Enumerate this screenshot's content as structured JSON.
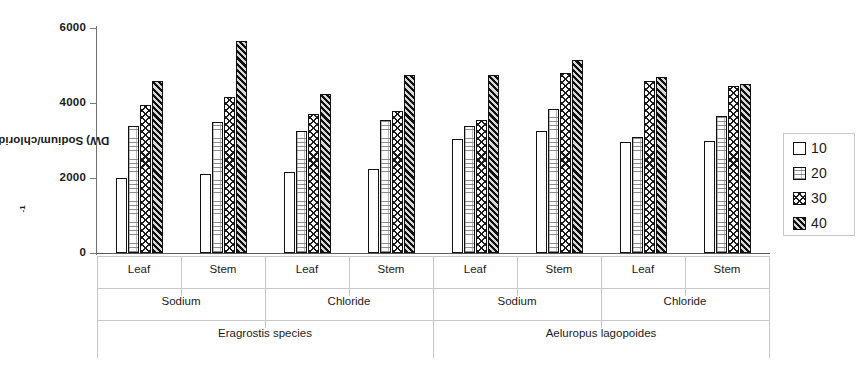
{
  "chart_data": {
    "type": "bar",
    "title": "",
    "xlabel": "",
    "ylabel": "Sodium/chloride (µmole g DW)",
    "ylabel_parts": {
      "main": "Sodium/chloride (µmole g",
      "sup": "-1",
      "tail": " DW)"
    },
    "ylim": [
      0,
      6000
    ],
    "yticks": [
      0,
      2000,
      4000,
      6000
    ],
    "ytick_labels": [
      "0",
      "2000",
      "4000",
      "6000"
    ],
    "grid": false,
    "legend_position": "right",
    "legend_title": "",
    "series": [
      {
        "name": "10",
        "pattern": "plain-white",
        "values": [
          2000,
          2100,
          2150,
          2250,
          3050,
          3250,
          2950,
          3000
        ]
      },
      {
        "name": "20",
        "pattern": "light-dotted",
        "values": [
          3400,
          3500,
          3250,
          3550,
          3400,
          3850,
          3100,
          3650
        ]
      },
      {
        "name": "30",
        "pattern": "cross-hatch",
        "values": [
          3950,
          4150,
          3700,
          3800,
          3550,
          4800,
          4600,
          4450
        ]
      },
      {
        "name": "40",
        "pattern": "dark-diagonal-hatch",
        "values": [
          4600,
          5650,
          4250,
          4750,
          4750,
          5150,
          4700,
          4500
        ]
      }
    ],
    "categories": [
      "Leaf",
      "Stem",
      "Leaf",
      "Stem",
      "Leaf",
      "Stem",
      "Leaf",
      "Stem"
    ],
    "category_tiers": {
      "tier1": [
        "Leaf",
        "Stem",
        "Leaf",
        "Stem",
        "Leaf",
        "Stem",
        "Leaf",
        "Stem"
      ],
      "tier2": [
        "Sodium",
        "Chloride",
        "Sodium",
        "Chloride"
      ],
      "tier3": [
        "Eragrostis species",
        "Aeluropus lagopoides"
      ]
    }
  },
  "axis": {
    "y_title_main": "Sodium/chloride (µmole g",
    "y_title_sup": "-1",
    "y_title_tail": " DW)",
    "ticks": {
      "t0": "0",
      "t1": "2000",
      "t2": "4000",
      "t3": "6000"
    }
  },
  "groups": {
    "g0": "Leaf",
    "g1": "Stem",
    "g2": "Leaf",
    "g3": "Stem",
    "g4": "Leaf",
    "g5": "Stem",
    "g6": "Leaf",
    "g7": "Stem"
  },
  "ions": {
    "i0": "Sodium",
    "i1": "Chloride",
    "i2": "Sodium",
    "i3": "Chloride"
  },
  "species": {
    "s0": "Eragrostis species",
    "s1": "Aeluropus lagopoides"
  },
  "legend": {
    "items": [
      {
        "label": "10"
      },
      {
        "label": "20"
      },
      {
        "label": "30"
      },
      {
        "label": "40"
      }
    ]
  }
}
